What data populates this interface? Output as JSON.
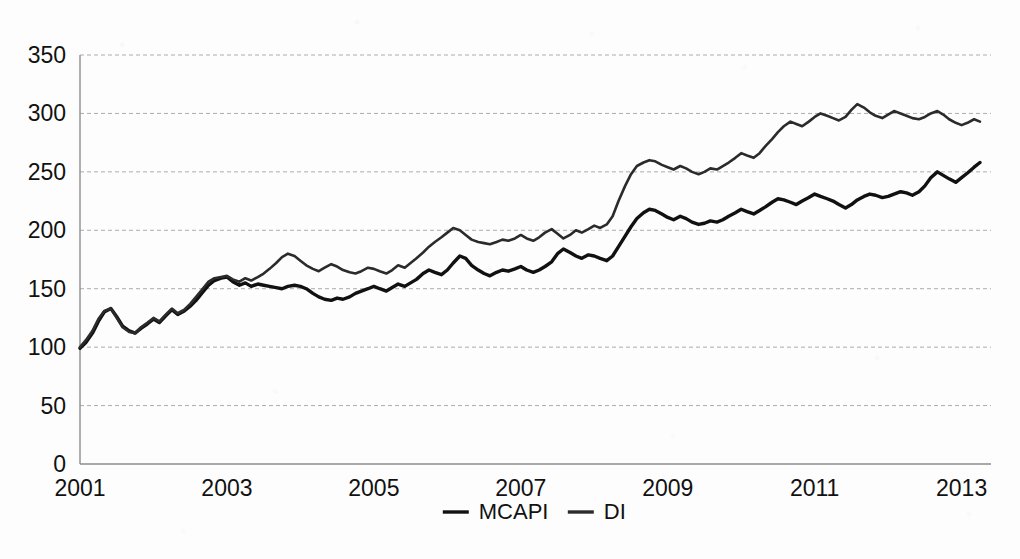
{
  "chart_data": {
    "type": "line",
    "title": "",
    "subtitle": "",
    "xlabel": "",
    "ylabel": "",
    "xlim": [
      2001,
      2013.4
    ],
    "ylim": [
      0,
      350
    ],
    "grid": true,
    "legend_position": "bottom-center",
    "y_ticks": [
      0,
      50,
      100,
      150,
      200,
      250,
      300,
      350
    ],
    "y_tick_labels": [
      "0",
      "50",
      "100",
      "150",
      "200",
      "250",
      "300",
      "350"
    ],
    "x_ticks": [
      2001,
      2003,
      2005,
      2007,
      2009,
      2011,
      2013
    ],
    "x_tick_labels": [
      "2001",
      "2003",
      "2005",
      "2007",
      "2009",
      "2011",
      "2013"
    ],
    "series": [
      {
        "name": "MCAPI",
        "color": "#111111",
        "width": 3.4,
        "x": [
          2001.0,
          2001.08,
          2001.17,
          2001.25,
          2001.33,
          2001.42,
          2001.5,
          2001.58,
          2001.67,
          2001.75,
          2001.83,
          2001.92,
          2002.0,
          2002.08,
          2002.17,
          2002.25,
          2002.33,
          2002.42,
          2002.5,
          2002.58,
          2002.67,
          2002.75,
          2002.83,
          2002.92,
          2003.0,
          2003.08,
          2003.17,
          2003.25,
          2003.33,
          2003.42,
          2003.5,
          2003.58,
          2003.67,
          2003.75,
          2003.83,
          2003.92,
          2004.0,
          2004.08,
          2004.17,
          2004.25,
          2004.33,
          2004.42,
          2004.5,
          2004.58,
          2004.67,
          2004.75,
          2004.83,
          2004.92,
          2005.0,
          2005.08,
          2005.17,
          2005.25,
          2005.33,
          2005.42,
          2005.5,
          2005.58,
          2005.67,
          2005.75,
          2005.83,
          2005.92,
          2006.0,
          2006.08,
          2006.17,
          2006.25,
          2006.33,
          2006.42,
          2006.5,
          2006.58,
          2006.67,
          2006.75,
          2006.83,
          2006.92,
          2007.0,
          2007.08,
          2007.17,
          2007.25,
          2007.33,
          2007.42,
          2007.5,
          2007.58,
          2007.67,
          2007.75,
          2007.83,
          2007.92,
          2008.0,
          2008.08,
          2008.17,
          2008.25,
          2008.33,
          2008.42,
          2008.5,
          2008.58,
          2008.67,
          2008.75,
          2008.83,
          2008.92,
          2009.0,
          2009.08,
          2009.17,
          2009.25,
          2009.33,
          2009.42,
          2009.5,
          2009.58,
          2009.67,
          2009.75,
          2009.83,
          2009.92,
          2010.0,
          2010.08,
          2010.17,
          2010.25,
          2010.33,
          2010.42,
          2010.5,
          2010.58,
          2010.67,
          2010.75,
          2010.83,
          2010.92,
          2011.0,
          2011.08,
          2011.17,
          2011.25,
          2011.33,
          2011.42,
          2011.5,
          2011.58,
          2011.67,
          2011.75,
          2011.83,
          2011.92,
          2012.0,
          2012.08,
          2012.17,
          2012.25,
          2012.33,
          2012.42,
          2012.5,
          2012.58,
          2012.67,
          2012.75,
          2012.83,
          2012.92,
          2013.0,
          2013.08,
          2013.17,
          2013.25
        ],
        "values": [
          99,
          104,
          112,
          122,
          130,
          133,
          126,
          118,
          114,
          112,
          116,
          120,
          124,
          121,
          127,
          132,
          128,
          131,
          135,
          140,
          147,
          153,
          157,
          159,
          160,
          156,
          153,
          155,
          152,
          154,
          153,
          152,
          151,
          150,
          152,
          153,
          152,
          150,
          146,
          143,
          141,
          140,
          142,
          141,
          143,
          146,
          148,
          150,
          152,
          150,
          148,
          151,
          154,
          152,
          155,
          158,
          163,
          166,
          164,
          162,
          166,
          172,
          178,
          176,
          170,
          166,
          163,
          161,
          164,
          166,
          165,
          167,
          169,
          166,
          164,
          166,
          169,
          173,
          180,
          184,
          181,
          178,
          176,
          179,
          178,
          176,
          174,
          178,
          186,
          195,
          203,
          210,
          215,
          218,
          217,
          214,
          211,
          209,
          212,
          210,
          207,
          205,
          206,
          208,
          207,
          209,
          212,
          215,
          218,
          216,
          214,
          217,
          220,
          224,
          227,
          226,
          224,
          222,
          225,
          228,
          231,
          229,
          227,
          225,
          222,
          219,
          222,
          226,
          229,
          231,
          230,
          228,
          229,
          231,
          233,
          232,
          230,
          233,
          238,
          245,
          250,
          247,
          244,
          241,
          245,
          249,
          254,
          258
        ]
      },
      {
        "name": "DI",
        "color": "#2b2b2b",
        "width": 2.6,
        "x": [
          2001.0,
          2001.08,
          2001.17,
          2001.25,
          2001.33,
          2001.42,
          2001.5,
          2001.58,
          2001.67,
          2001.75,
          2001.83,
          2001.92,
          2002.0,
          2002.08,
          2002.17,
          2002.25,
          2002.33,
          2002.42,
          2002.5,
          2002.58,
          2002.67,
          2002.75,
          2002.83,
          2002.92,
          2003.0,
          2003.08,
          2003.17,
          2003.25,
          2003.33,
          2003.42,
          2003.5,
          2003.58,
          2003.67,
          2003.75,
          2003.83,
          2003.92,
          2004.0,
          2004.08,
          2004.17,
          2004.25,
          2004.33,
          2004.42,
          2004.5,
          2004.58,
          2004.67,
          2004.75,
          2004.83,
          2004.92,
          2005.0,
          2005.08,
          2005.17,
          2005.25,
          2005.33,
          2005.42,
          2005.5,
          2005.58,
          2005.67,
          2005.75,
          2005.83,
          2005.92,
          2006.0,
          2006.08,
          2006.17,
          2006.25,
          2006.33,
          2006.42,
          2006.5,
          2006.58,
          2006.67,
          2006.75,
          2006.83,
          2006.92,
          2007.0,
          2007.08,
          2007.17,
          2007.25,
          2007.33,
          2007.42,
          2007.5,
          2007.58,
          2007.67,
          2007.75,
          2007.83,
          2007.92,
          2008.0,
          2008.08,
          2008.17,
          2008.25,
          2008.33,
          2008.42,
          2008.5,
          2008.58,
          2008.67,
          2008.75,
          2008.83,
          2008.92,
          2009.0,
          2009.08,
          2009.17,
          2009.25,
          2009.33,
          2009.42,
          2009.5,
          2009.58,
          2009.67,
          2009.75,
          2009.83,
          2009.92,
          2010.0,
          2010.08,
          2010.17,
          2010.25,
          2010.33,
          2010.42,
          2010.5,
          2010.58,
          2010.67,
          2010.75,
          2010.83,
          2010.92,
          2011.0,
          2011.08,
          2011.17,
          2011.25,
          2011.33,
          2011.42,
          2011.5,
          2011.58,
          2011.67,
          2011.75,
          2011.83,
          2011.92,
          2012.0,
          2012.08,
          2012.17,
          2012.25,
          2012.33,
          2012.42,
          2012.5,
          2012.58,
          2012.67,
          2012.75,
          2012.83,
          2012.92,
          2013.0,
          2013.08,
          2013.17,
          2013.25
        ],
        "values": [
          100,
          106,
          114,
          124,
          131,
          133,
          125,
          117,
          113,
          112,
          117,
          121,
          125,
          122,
          128,
          133,
          129,
          132,
          137,
          143,
          150,
          156,
          159,
          160,
          161,
          158,
          156,
          159,
          157,
          160,
          163,
          167,
          172,
          177,
          180,
          178,
          174,
          170,
          167,
          165,
          168,
          171,
          169,
          166,
          164,
          163,
          165,
          168,
          167,
          165,
          163,
          166,
          170,
          168,
          172,
          176,
          181,
          186,
          190,
          194,
          198,
          202,
          200,
          196,
          192,
          190,
          189,
          188,
          190,
          192,
          191,
          193,
          196,
          193,
          191,
          194,
          198,
          201,
          197,
          193,
          196,
          200,
          198,
          201,
          204,
          202,
          205,
          212,
          225,
          238,
          248,
          255,
          258,
          260,
          259,
          256,
          254,
          252,
          255,
          253,
          250,
          248,
          250,
          253,
          252,
          255,
          258,
          262,
          266,
          264,
          262,
          266,
          272,
          278,
          284,
          289,
          293,
          291,
          289,
          293,
          297,
          300,
          298,
          296,
          294,
          297,
          303,
          308,
          305,
          301,
          298,
          296,
          299,
          302,
          300,
          298,
          296,
          295,
          297,
          300,
          302,
          299,
          295,
          292,
          290,
          292,
          295,
          293
        ]
      }
    ],
    "legend": [
      {
        "label": "MCAPI",
        "color": "#111111"
      },
      {
        "label": "DI",
        "color": "#2b2b2b"
      }
    ]
  }
}
